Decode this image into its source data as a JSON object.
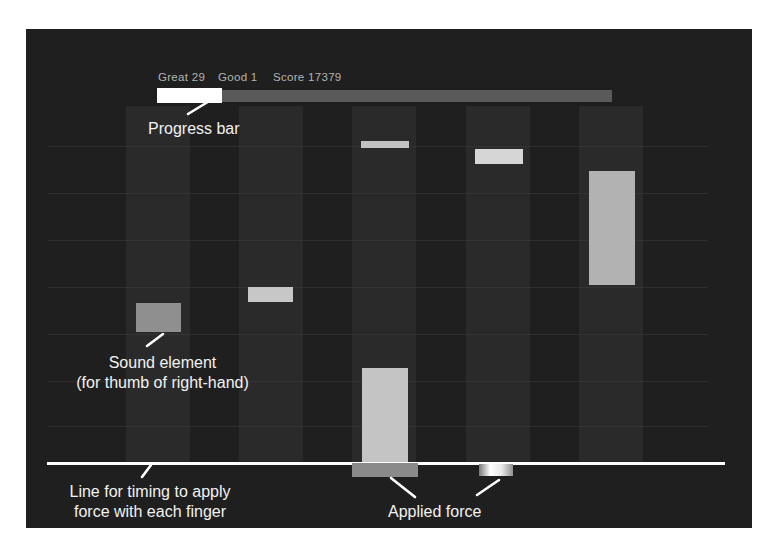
{
  "hud": {
    "great": {
      "label": "Great",
      "value": "29"
    },
    "good": {
      "label": "Good",
      "value": "1"
    },
    "score": {
      "label": "Score",
      "value": "17379"
    },
    "progress": {
      "filled_fraction": 0.14
    }
  },
  "annotations": {
    "progress_bar": "Progress bar",
    "sound_element_line1": "Sound element",
    "sound_element_line2": "(for thumb of right-hand)",
    "timing_line_line1": "Line for timing to apply",
    "timing_line_line2": "force with each finger",
    "applied_force": "Applied force"
  },
  "game": {
    "lanes": {
      "centers": [
        158,
        271,
        384,
        498,
        611
      ],
      "stripe_width": 64,
      "top": 106,
      "bottom": 463
    },
    "gridlines_y": [
      146,
      193,
      240,
      287,
      334,
      381,
      426
    ],
    "notes": [
      {
        "name": "note-lane1-sound-element",
        "lane": 1,
        "x": 136,
        "y": 303,
        "w": 45,
        "h": 29,
        "color": "#8f8f8f"
      },
      {
        "name": "note-lane2",
        "lane": 2,
        "x": 248,
        "y": 287,
        "w": 45,
        "h": 15,
        "color": "#c7c7c7"
      },
      {
        "name": "note-lane3-upper",
        "lane": 3,
        "x": 361,
        "y": 141,
        "w": 48,
        "h": 7,
        "color": "#c2c2c2"
      },
      {
        "name": "note-lane4",
        "lane": 4,
        "x": 475,
        "y": 149,
        "w": 48,
        "h": 15,
        "color": "#d6d6d6"
      },
      {
        "name": "note-lane5",
        "lane": 5,
        "x": 589,
        "y": 171,
        "w": 46,
        "h": 114,
        "color": "#b2b2b2"
      },
      {
        "name": "note-lane3-at-line",
        "lane": 3,
        "x": 362,
        "y": 368,
        "w": 46,
        "h": 95,
        "color": "#c4c4c4"
      }
    ],
    "force_bars": [
      {
        "name": "applied-force-bar-lane3",
        "x": 352,
        "y": 463,
        "w": 66,
        "h": 14,
        "color": "#8a8a8a"
      },
      {
        "name": "applied-force-bar-lane4",
        "x": 479,
        "y": 464,
        "w": 34,
        "h": 12,
        "gradient": [
          "#787878",
          "#ffffff",
          "#e8e8e8",
          "#909090"
        ]
      }
    ]
  },
  "colors": {
    "screen_bg": "#1f1f1f",
    "lane_stripe": "#2a2a2a",
    "gridline": "#3a3a3a",
    "timing_line": "#ffffff",
    "progress_fill": "#ffffff",
    "progress_track": "#5a5a5a",
    "stats_text": "#b3b3b3",
    "annotation_text": "#f2f2f2",
    "callout": "#ffffff"
  }
}
